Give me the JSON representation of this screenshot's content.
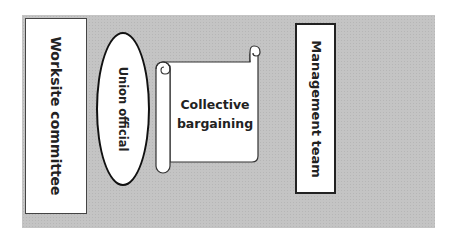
{
  "diagram": {
    "background_color": "#c4c4c4",
    "nodes": [
      {
        "id": "worksite",
        "label": "Worksite committee",
        "shape": "rectangle",
        "orientation": "vertical"
      },
      {
        "id": "union",
        "label": "Union official",
        "shape": "ellipse",
        "orientation": "vertical"
      },
      {
        "id": "bargaining",
        "line1": "Collective",
        "line2": "bargaining",
        "shape": "scroll",
        "orientation": "horizontal"
      },
      {
        "id": "management",
        "label": "Management team",
        "shape": "rectangle",
        "orientation": "vertical"
      }
    ]
  }
}
